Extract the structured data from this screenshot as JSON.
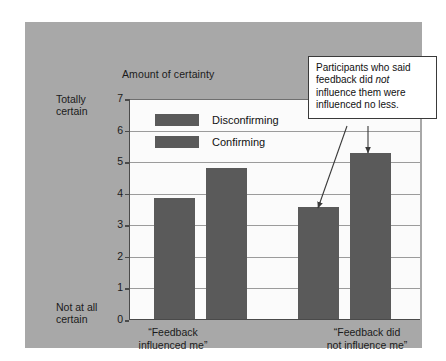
{
  "chart_data": {
    "type": "bar",
    "title": "",
    "ylabel": "Amount of certainty",
    "xlabel": "",
    "ylim": [
      0,
      7
    ],
    "yticks": [
      0,
      1,
      2,
      3,
      4,
      5,
      6,
      7
    ],
    "ytick_labels": [
      "0",
      "1",
      "2",
      "3",
      "4",
      "5",
      "6",
      "7"
    ],
    "y_axis_endpoint_top": "Totally\ncertain",
    "y_axis_endpoint_top_line1": "Totally",
    "y_axis_endpoint_top_line2": "certain",
    "y_axis_endpoint_bottom_line1": "Not at all",
    "y_axis_endpoint_bottom_line2": "certain",
    "grid": true,
    "legend_position": "upper-left-inside",
    "categories": [
      "“Feedback influenced me”",
      "“Feedback did not influence me”"
    ],
    "category_labels": [
      {
        "line1": "“Feedback",
        "line2": "influenced me”"
      },
      {
        "line1": "“Feedback did",
        "line2": "not influence me”"
      }
    ],
    "series": [
      {
        "name": "Disconfirming",
        "values": [
          3.83,
          3.55
        ],
        "color": "#5a5a5a"
      },
      {
        "name": "Confirming",
        "values": [
          4.77,
          5.25
        ],
        "color": "#5a5a5a"
      }
    ]
  },
  "annotation": {
    "callout_line1": "Participants who said",
    "callout_line2_a": "feedback did ",
    "callout_line2_em": "not",
    "callout_line3": "influence them were",
    "callout_line4": "influenced no less.",
    "arrow_targets": [
      "disconfirming-bar-not-influenced",
      "confirming-bar-not-influenced"
    ]
  },
  "colors": {
    "figure_background": "#a8a8a8",
    "plot_background": "#fbfbfb",
    "bar_fill": "#5a5a5a",
    "axis": "#4a4a4a",
    "gridline": "#9b9b9b",
    "text": "#1b1b1b",
    "callout_border": "#3a3a3a",
    "page_background": "#ffffff"
  }
}
